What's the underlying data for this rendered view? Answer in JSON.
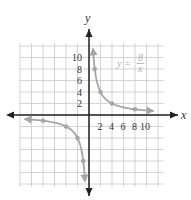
{
  "marker": "•",
  "chart_data": {
    "type": "line",
    "title": "",
    "equation": {
      "lhs": "y =",
      "num": "8",
      "den": "x"
    },
    "xlabel": "x",
    "ylabel": "y",
    "x_ticks": [
      "2",
      "4",
      "6",
      "8",
      "10"
    ],
    "y_ticks": [
      "2",
      "4",
      "6",
      "8",
      "10"
    ],
    "xlim": [
      -12,
      12
    ],
    "ylim": [
      -12,
      12
    ],
    "grid": true,
    "series": [
      {
        "name": "y = 8/x",
        "points": [
          [
            1,
            8
          ],
          [
            2,
            4
          ],
          [
            4,
            2
          ],
          [
            8,
            1
          ],
          [
            -1,
            -8
          ],
          [
            -2,
            -4
          ],
          [
            -4,
            -2
          ],
          [
            -8,
            -1
          ]
        ]
      }
    ],
    "colors": {
      "curve": "#a6a6a6",
      "axes": "#222222",
      "grid": "#c8c8c8"
    }
  }
}
